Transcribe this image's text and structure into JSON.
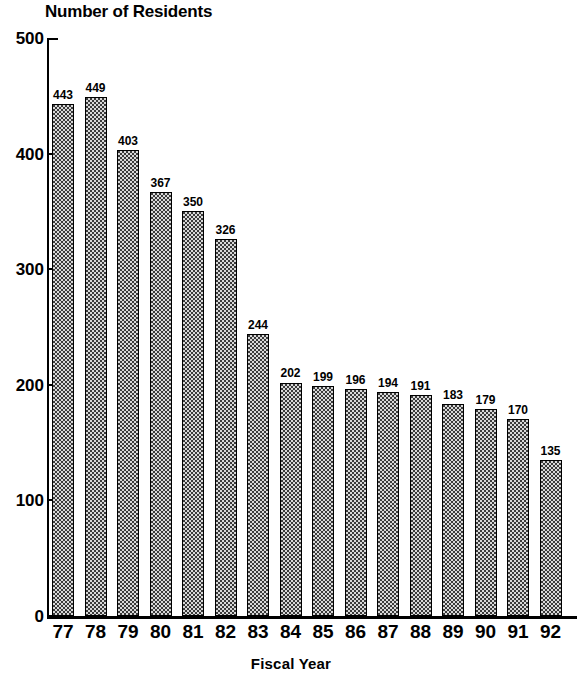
{
  "chart_data": {
    "type": "bar",
    "title": "Number of Residents",
    "xlabel": "Fiscal Year",
    "ylabel": "",
    "categories": [
      "77",
      "78",
      "79",
      "80",
      "81",
      "82",
      "83",
      "84",
      "85",
      "86",
      "87",
      "88",
      "89",
      "90",
      "91",
      "92"
    ],
    "values": [
      443,
      449,
      403,
      367,
      350,
      326,
      244,
      202,
      199,
      196,
      194,
      191,
      183,
      179,
      170,
      135
    ],
    "ylim": [
      0,
      500
    ],
    "yticks": [
      0,
      100,
      200,
      300,
      400,
      500
    ],
    "ytick_labels": [
      "0",
      "100",
      "200",
      "300",
      "400",
      "500"
    ],
    "grid": false,
    "legend": null,
    "bar_fill": "checkerboard-dark",
    "colors": {
      "axis": "#000000",
      "bar_fill_dark": "#3a3a3a",
      "bar_fill_light": "#d8d8d8",
      "bar_border": "#000000",
      "text": "#000000",
      "background": "#ffffff"
    },
    "data_labels": [
      "443",
      "449",
      "403",
      "367",
      "350",
      "326",
      "244",
      "202",
      "199",
      "196",
      "194",
      "191",
      "183",
      "179",
      "170",
      "135"
    ]
  }
}
